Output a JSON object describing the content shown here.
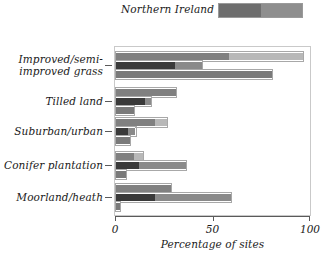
{
  "chart_data": {
    "type": "bar",
    "orientation": "horizontal",
    "title": "",
    "subtitle": "",
    "xlabel": "Percentage of sites",
    "ylabel": "",
    "xlim": [
      0,
      100
    ],
    "xticks": [
      0,
      50,
      100
    ],
    "xtick_labels": [
      "0",
      "50",
      "100"
    ],
    "grid": false,
    "legend_position": "top-right",
    "legend_entries": [
      {
        "label": "Northern Ireland",
        "colors": [
          "#6e6e6e",
          "#8e8e8e"
        ]
      }
    ],
    "categories": [
      "Improved/semi-\nimproved grass",
      "Tilled land",
      "Suburban/urban",
      "Conifer plantation",
      "Moorland/heath"
    ],
    "series": [
      {
        "name": "bar-1",
        "stacked_segments": [
          {
            "name": "segment-a",
            "color": "#808080",
            "values": [
              58,
              31,
              20,
              9,
              28
            ]
          },
          {
            "name": "segment-b",
            "color": "#b8b8b8",
            "values": [
              38,
              0,
              6,
              5,
              0
            ]
          }
        ]
      },
      {
        "name": "bar-2",
        "stacked_segments": [
          {
            "name": "segment-a",
            "color": "#3a3a3a",
            "values": [
              30,
              15,
              6,
              12,
              20
            ]
          },
          {
            "name": "segment-b",
            "color": "#8a8a8a",
            "values": [
              14,
              3,
              4,
              24,
              39
            ]
          }
        ]
      },
      {
        "name": "bar-3",
        "stacked_segments": [
          {
            "name": "segment-a",
            "color": "#7a7a7a",
            "values": [
              80,
              9,
              7,
              5,
              2
            ]
          }
        ]
      }
    ],
    "colors": {
      "dark": "#3a3a3a",
      "medium": "#808080",
      "medium_light": "#8a8a8a",
      "light": "#b8b8b8",
      "frame": "#c9c9c9",
      "axis": "#5a5a5a"
    }
  },
  "axis": {
    "x_title": "Percentage of sites",
    "tick_labels": [
      "0",
      "50",
      "100"
    ]
  },
  "legend": {
    "label": "Northern Ireland"
  },
  "categories": {
    "c0": "Improved/semi-\nimproved grass",
    "c1": "Tilled land",
    "c2": "Suburban/urban",
    "c3": "Conifer plantation",
    "c4": "Moorland/heath"
  }
}
